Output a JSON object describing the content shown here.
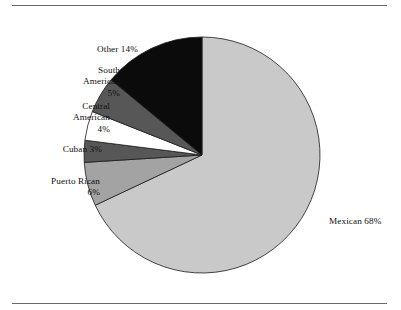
{
  "chart_data": {
    "type": "pie",
    "title": "",
    "subtitle": "",
    "xlabel": "",
    "ylabel": "",
    "legend_position": "none",
    "grid": false,
    "labels_position": "outside",
    "start_angle_deg": 0,
    "direction": "clockwise",
    "units": "percent",
    "total": 100,
    "categories": [
      "Mexican",
      "Puerto Rican",
      "Cuban",
      "Central American",
      "South American",
      "Other"
    ],
    "values": [
      68,
      6,
      3,
      4,
      5,
      14
    ],
    "slices": [
      {
        "name": "Mexican",
        "value": 68,
        "value_text": "68%",
        "label": "Mexican 68%",
        "color": "#c9c9c9",
        "label_align": "left"
      },
      {
        "name": "Puerto Rican",
        "value": 6,
        "value_text": "6%",
        "label": "Puerto Rican\n6%",
        "color": "#a3a3a3",
        "label_align": "right"
      },
      {
        "name": "Cuban",
        "value": 3,
        "value_text": "3%",
        "label": "Cuban 3%",
        "color": "#575757",
        "label_align": "right"
      },
      {
        "name": "Central American",
        "value": 4,
        "value_text": "4%",
        "label": "Central\nAmerican\n4%",
        "color": "#ffffff",
        "label_align": "right"
      },
      {
        "name": "South American",
        "value": 5,
        "value_text": "5%",
        "label": "South\nAmerican\n5%",
        "color": "#575757",
        "label_align": "right"
      },
      {
        "name": "Other",
        "value": 14,
        "value_text": "14%",
        "label": "Other 14%",
        "color": "#0b0b0b",
        "label_align": "right"
      }
    ]
  },
  "figure": {
    "outline_color": "#6a6a6a",
    "background": "#ffffff",
    "slice_stroke": "#1a1a1a"
  }
}
